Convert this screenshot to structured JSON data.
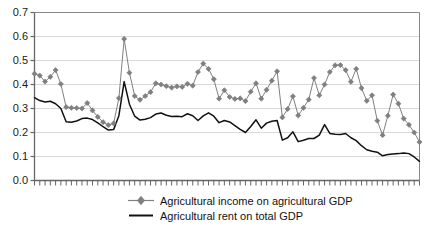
{
  "chart_data": {
    "type": "line",
    "title": "",
    "subtitle": "",
    "xlabel": "",
    "ylabel": "",
    "ylim": [
      0.0,
      0.7
    ],
    "ytick_labels": [
      "0.0",
      "0.1",
      "0.2",
      "0.3",
      "0.4",
      "0.5",
      "0.6",
      "0.7"
    ],
    "ytick_values": [
      0.0,
      0.1,
      0.2,
      0.3,
      0.4,
      0.5,
      0.6,
      0.7
    ],
    "xtick_labels": [],
    "grid": "horizontal",
    "legend_position": "bottom",
    "n_points": 74,
    "series": [
      {
        "name": "Agricultural income on agricultural GDP",
        "color": "#808080",
        "marker": "diamond",
        "line_style": "solid",
        "values": [
          0.445,
          0.437,
          0.412,
          0.432,
          0.46,
          0.402,
          0.306,
          0.303,
          0.302,
          0.3,
          0.323,
          0.292,
          0.265,
          0.243,
          0.231,
          0.238,
          0.343,
          0.59,
          0.449,
          0.352,
          0.336,
          0.352,
          0.368,
          0.405,
          0.4,
          0.393,
          0.387,
          0.392,
          0.39,
          0.403,
          0.395,
          0.452,
          0.487,
          0.465,
          0.422,
          0.341,
          0.376,
          0.348,
          0.34,
          0.342,
          0.331,
          0.37,
          0.405,
          0.341,
          0.378,
          0.416,
          0.455,
          0.263,
          0.298,
          0.351,
          0.271,
          0.303,
          0.337,
          0.427,
          0.355,
          0.4,
          0.452,
          0.48,
          0.481,
          0.46,
          0.411,
          0.465,
          0.385,
          0.332,
          0.355,
          0.249,
          0.189,
          0.27,
          0.358,
          0.32,
          0.258,
          0.232,
          0.2,
          0.16
        ]
      },
      {
        "name": "Agricultural rent on total GDP",
        "color": "#111111",
        "marker": "none",
        "line_style": "solid",
        "values": [
          0.345,
          0.333,
          0.327,
          0.33,
          0.32,
          0.3,
          0.245,
          0.243,
          0.248,
          0.258,
          0.26,
          0.254,
          0.24,
          0.224,
          0.21,
          0.212,
          0.27,
          0.412,
          0.318,
          0.268,
          0.252,
          0.255,
          0.262,
          0.277,
          0.281,
          0.272,
          0.267,
          0.268,
          0.266,
          0.278,
          0.27,
          0.25,
          0.269,
          0.282,
          0.268,
          0.241,
          0.25,
          0.244,
          0.229,
          0.213,
          0.2,
          0.225,
          0.253,
          0.218,
          0.239,
          0.247,
          0.25,
          0.168,
          0.178,
          0.203,
          0.162,
          0.168,
          0.175,
          0.175,
          0.189,
          0.233,
          0.196,
          0.193,
          0.192,
          0.196,
          0.178,
          0.166,
          0.145,
          0.128,
          0.122,
          0.118,
          0.103,
          0.108,
          0.11,
          0.112,
          0.115,
          0.112,
          0.098,
          0.08
        ]
      }
    ]
  },
  "legend": {
    "entries": [
      {
        "label": "Agricultural income on agricultural GDP",
        "key": "diamond-line-key"
      },
      {
        "label": "Agricultural rent on total GDP",
        "key": "solid-line-key"
      }
    ]
  },
  "colors": {
    "series1": "#808080",
    "series2": "#111111",
    "grid": "#d9d9d9",
    "axis": "#666666",
    "text": "#111111",
    "background": "#ffffff"
  }
}
